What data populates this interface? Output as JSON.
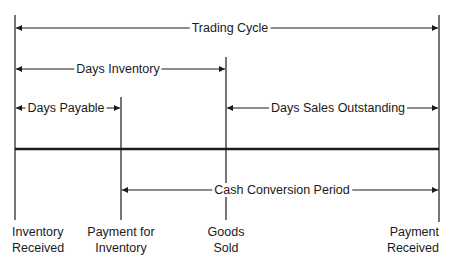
{
  "diagram": {
    "title": "Trading Cycle",
    "spans": [
      {
        "label": "Trading Cycle",
        "from": "Inventory Received",
        "to": "Payment Received"
      },
      {
        "label": "Days Inventory",
        "from": "Inventory Received",
        "to": "Goods Sold"
      },
      {
        "label": "Days Payable",
        "from": "Inventory Received",
        "to": "Payment for Inventory"
      },
      {
        "label": "Days Sales Outstanding",
        "from": "Goods Sold",
        "to": "Payment Received"
      },
      {
        "label": "Cash Conversion Period",
        "from": "Payment for Inventory",
        "to": "Payment Received"
      }
    ],
    "events": [
      {
        "line1": "Inventory",
        "line2": "Received"
      },
      {
        "line1": "Payment for",
        "line2": "Inventory"
      },
      {
        "line1": "Goods",
        "line2": "Sold"
      },
      {
        "line1": "Payment",
        "line2": "Received"
      }
    ],
    "colors": {
      "line": "#1a1a1a",
      "background": "#ffffff"
    }
  }
}
